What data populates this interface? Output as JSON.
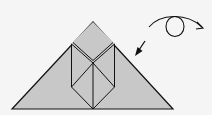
{
  "diagram": {
    "type": "origami-step",
    "colors": {
      "background": "#f5f5f5",
      "paper": "#c8c8c8",
      "stroke": "#111111"
    },
    "symbols": [
      {
        "name": "fold-arrow",
        "meaning": "fold in direction of arrow"
      },
      {
        "name": "turn-over-arrow",
        "meaning": "turn the model over"
      }
    ]
  }
}
